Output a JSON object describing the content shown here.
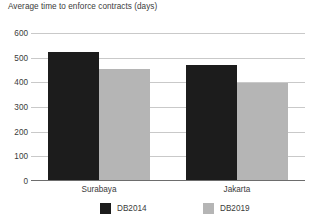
{
  "chart_data": {
    "type": "bar",
    "title": "Average time to enforce contracts (days)",
    "title_line1": "Average time to enforce contracts",
    "title_line2": "(days)",
    "xlabel": "",
    "ylabel": "",
    "ylim": [
      0,
      600
    ],
    "yticks": [
      600,
      500,
      400,
      300,
      200,
      100,
      0
    ],
    "ytick_labels": [
      "600",
      "500",
      "400",
      "300",
      "200",
      "100",
      "0"
    ],
    "grid": true,
    "grid_axis": "y",
    "legend_position": "bottom",
    "categories": [
      "Surabaya",
      "Jakarta"
    ],
    "series": [
      {
        "name": "DB2014",
        "color": "#1c1c1c",
        "values": [
          520,
          465
        ]
      },
      {
        "name": "DB2019",
        "color": "#b5b5b5",
        "values": [
          450,
          395
        ]
      }
    ]
  },
  "colors": {
    "series_db2014": "#1c1c1c",
    "series_db2019": "#b5b5b5",
    "gridline": "#c9c9c9",
    "axis": "#6d6d6d",
    "text": "#3b3b3b",
    "background": "#ffffff"
  }
}
